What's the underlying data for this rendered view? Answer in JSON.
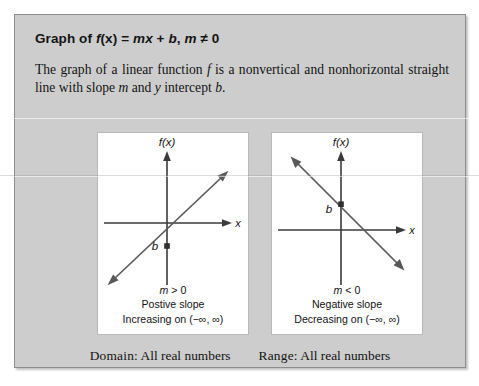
{
  "box": {
    "heading": {
      "prefix": "Graph of ",
      "f": "f",
      "of_x": "(x)",
      "equals": " = ",
      "m": "m",
      "x": "x",
      "plus": " + ",
      "b": "b",
      "comma": ", ",
      "m2": "m",
      "neq": " ≠ ",
      "zero": "0",
      "full_text": "Graph of f(x) = mx + b, m ≠ 0"
    },
    "intro": {
      "part1": "The graph of a linear function ",
      "f": "f",
      "part2": " is a nonvertical and nonhorizontal straight line with slope ",
      "m": "m",
      "part3": " and ",
      "y": "y",
      "part4": " intercept ",
      "b": "b",
      "part5": ".",
      "full_text": "The graph of a linear function f is a nonvertical and nonhorizontal straight line with slope m and y intercept b."
    },
    "panels": [
      {
        "id": "positive-slope",
        "axis_y_label": "f(x)",
        "axis_x_label": "x",
        "intercept_label": "b",
        "caption_condition_var": "m",
        "caption_condition_rest": " > 0",
        "caption_condition": "m > 0",
        "caption_line2": "Postive slope",
        "caption_line3": "Increasing on (−∞, ∞)"
      },
      {
        "id": "negative-slope",
        "axis_y_label": "f(x)",
        "axis_x_label": "x",
        "intercept_label": "b",
        "caption_condition_var": "m",
        "caption_condition_rest": " < 0",
        "caption_condition": "m < 0",
        "caption_line2": "Negative slope",
        "caption_line3": "Decreasing on (−∞, ∞)"
      }
    ],
    "footer": {
      "domain_label": "Domain:",
      "domain_value": "All real numbers",
      "range_label": "Range:",
      "range_value": "All real numbers"
    }
  },
  "colors": {
    "box_fill": "#cdcdcd",
    "box_border": "#8d8d8d",
    "panel_fill": "#ffffff",
    "panel_border": "#b9b9b9",
    "axis": "#3a3a3a",
    "line": "#5a5a5a",
    "text": "#131313"
  }
}
